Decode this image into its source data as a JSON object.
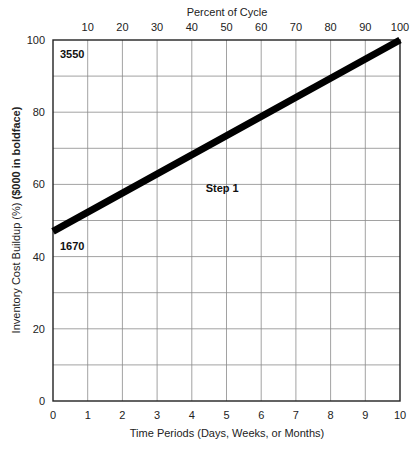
{
  "chart_data": {
    "type": "line",
    "title": "",
    "xlabel": "Time Periods (Days, Weeks, or Months)",
    "ylabel": "Inventory Cost Buildup (%) ($000 in boldface)",
    "ylabel_plain": "Inventory Cost Buildup (%) ",
    "ylabel_bold": "($000 in boldface)",
    "top_axis_label": "Percent of Cycle",
    "xlim": [
      0,
      10
    ],
    "ylim": [
      0,
      100
    ],
    "x_ticks": [
      "0",
      "1",
      "2",
      "3",
      "4",
      "5",
      "6",
      "7",
      "8",
      "9",
      "10"
    ],
    "y_ticks": [
      "0",
      "20",
      "40",
      "60",
      "80",
      "100"
    ],
    "top_ticks": [
      "10",
      "20",
      "30",
      "40",
      "50",
      "60",
      "70",
      "80",
      "90",
      "100"
    ],
    "grid": true,
    "grid_x_step": 1,
    "grid_y_step": 10,
    "series": [
      {
        "name": "Inventory cost buildup",
        "x": [
          0,
          10
        ],
        "y": [
          47,
          100
        ],
        "color": "#000000"
      }
    ],
    "annotations": [
      {
        "text": "3550",
        "x": 0.2,
        "y": 96,
        "bold": true
      },
      {
        "text": "1670",
        "x": 0.2,
        "y": 43,
        "bold": true
      },
      {
        "text": "Step 1",
        "x": 4.4,
        "y": 59,
        "bold": true
      }
    ]
  }
}
